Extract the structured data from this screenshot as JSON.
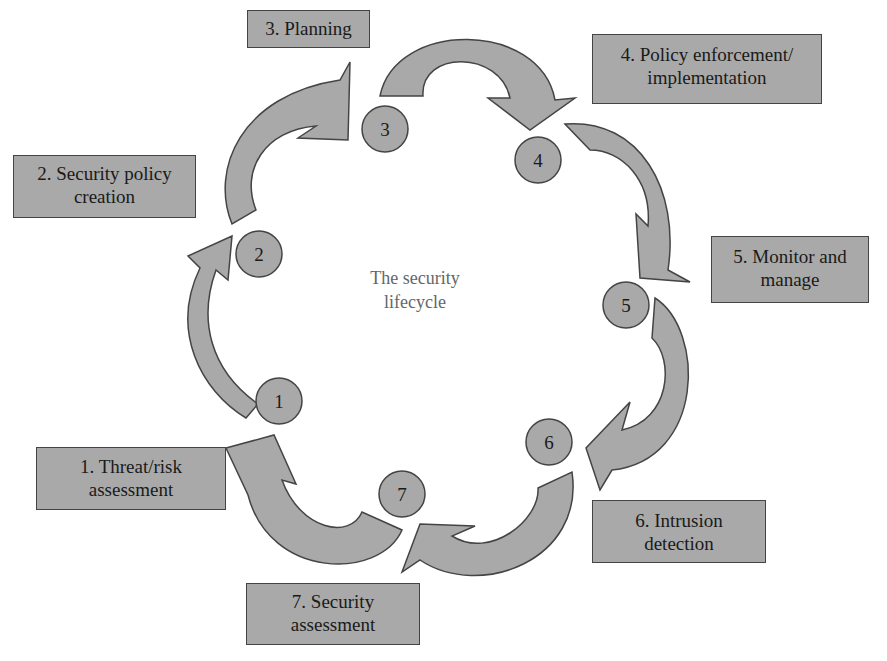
{
  "diagram": {
    "center_title": [
      "The security",
      "lifecycle"
    ],
    "colors": {
      "shape_fill": "#a9a9a9",
      "shape_stroke": "#444444",
      "text": "#1a1a1a",
      "center_text": "#666666",
      "background": "#ffffff"
    },
    "steps": [
      {
        "number": "1",
        "label_lines": [
          "1. Threat/risk",
          "assessment"
        ]
      },
      {
        "number": "2",
        "label_lines": [
          "2. Security policy",
          "creation"
        ]
      },
      {
        "number": "3",
        "label_lines": [
          "3. Planning"
        ]
      },
      {
        "number": "4",
        "label_lines": [
          "4. Policy enforcement/",
          "implementation"
        ]
      },
      {
        "number": "5",
        "label_lines": [
          "5. Monitor and",
          "manage"
        ]
      },
      {
        "number": "6",
        "label_lines": [
          "6. Intrusion",
          "detection"
        ]
      },
      {
        "number": "7",
        "label_lines": [
          "7. Security",
          "assessment"
        ]
      }
    ]
  }
}
